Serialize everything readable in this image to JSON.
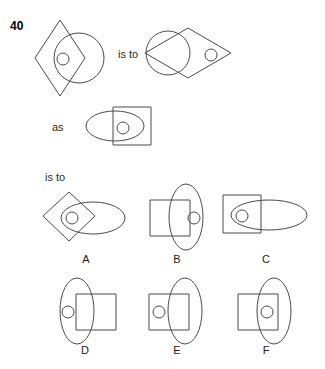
{
  "puzzle": {
    "number": "40",
    "connector_first": "is to",
    "connector_middle": "as",
    "connector_second": "is to"
  },
  "stem": {
    "left_figure": {
      "name": "vertical-diamond-with-circle-and-small-circle",
      "shapes": [
        "tall vertical diamond",
        "medium circle overlapping right side",
        "small circle at center"
      ]
    },
    "right_figure": {
      "name": "horizontal-diamond-with-circle-and-small-circle",
      "shapes": [
        "wide horizontal diamond",
        "medium circle overlapping left side",
        "small circle at right"
      ]
    }
  },
  "as_row": {
    "figure": {
      "name": "horizontal-ellipse-with-square-and-small-circle",
      "shapes": [
        "horizontal ellipse",
        "square overlapping right side",
        "small circle at overlap"
      ]
    }
  },
  "options": [
    {
      "letter": "A",
      "name": "option-a",
      "shapes": [
        "diamond at left",
        "horizontal ellipse at right",
        "small circle at overlap"
      ]
    },
    {
      "letter": "B",
      "name": "option-b",
      "shapes": [
        "square at left",
        "vertical ellipse at right",
        "small circle inside ellipse right portion"
      ]
    },
    {
      "letter": "C",
      "name": "option-c",
      "shapes": [
        "square at left",
        "horizontal ellipse at right",
        "small circle inside square overlap"
      ]
    },
    {
      "letter": "D",
      "name": "option-d",
      "shapes": [
        "vertical ellipse at left",
        "square at right",
        "small circle inside ellipse left portion"
      ]
    },
    {
      "letter": "E",
      "name": "option-e",
      "shapes": [
        "square at left",
        "vertical ellipse at right",
        "small circle inside square left portion"
      ]
    },
    {
      "letter": "F",
      "name": "option-f",
      "shapes": [
        "square at left",
        "vertical ellipse at right",
        "small circle at overlap"
      ]
    }
  ],
  "style": {
    "stroke_color": "#4a4a4a",
    "background": "#ffffff",
    "text_color": "#1a1a1a"
  }
}
